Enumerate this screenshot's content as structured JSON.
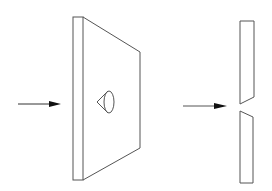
{
  "diagram": {
    "type": "schematic-illustration",
    "colors": {
      "background": "#ffffff",
      "stroke": "#555555",
      "arrow": "#222222"
    },
    "elements": [
      {
        "id": "arrow-left",
        "kind": "arrow",
        "from": [
          18,
          104
        ],
        "to": [
          61,
          104
        ]
      },
      {
        "id": "plate-3d",
        "kind": "plate-perspective",
        "front_edge": [
          73,
          17,
          83,
          180
        ],
        "far_edge_x": 140,
        "far_edge_y": [
          52,
          148
        ]
      },
      {
        "id": "conical-hole",
        "kind": "cone",
        "apex": [
          97,
          102
        ],
        "ellipse_center": [
          109,
          102
        ],
        "rx": 5,
        "ry": 11
      },
      {
        "id": "arrow-right",
        "kind": "arrow",
        "from": [
          183,
          106
        ],
        "to": [
          227,
          106
        ]
      },
      {
        "id": "cross-section-top",
        "kind": "slab",
        "points": [
          [
            240,
            21
          ],
          [
            254,
            21
          ],
          [
            254,
            97
          ],
          [
            240,
            104
          ]
        ]
      },
      {
        "id": "cross-section-bottom",
        "kind": "slab",
        "points": [
          [
            240,
            111
          ],
          [
            253,
            117
          ],
          [
            253,
            183
          ],
          [
            240,
            183
          ]
        ]
      }
    ]
  }
}
